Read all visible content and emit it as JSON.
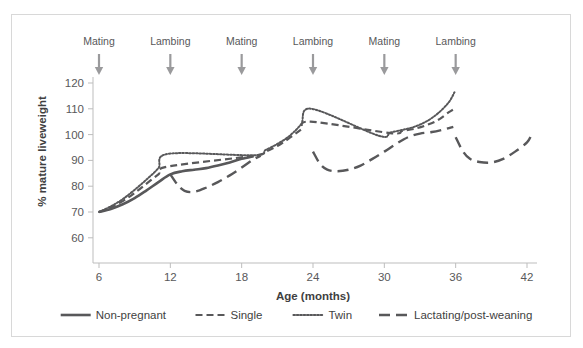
{
  "chart_data": {
    "type": "line",
    "title": "",
    "xlabel": "Age (months)",
    "ylabel": "% mature liveweight",
    "xlim": [
      6,
      42
    ],
    "ylim": [
      56,
      122
    ],
    "xticks": [
      6,
      12,
      18,
      24,
      30,
      36,
      42
    ],
    "yticks": [
      60,
      70,
      80,
      90,
      100,
      110,
      120
    ],
    "grid": false,
    "legend_position": "bottom",
    "line_color": "#58585a",
    "annotation_color": "#9a9a9c",
    "series": [
      {
        "name": "Non-pregnant",
        "style": "solid",
        "x": [
          6,
          7,
          8,
          9,
          10,
          11,
          12,
          13,
          14,
          15,
          16,
          17,
          18,
          19
        ],
        "values": [
          70,
          71.2,
          73.0,
          75.4,
          78.4,
          81.6,
          84.6,
          85.8,
          86.4,
          87.0,
          88.0,
          89.2,
          90.6,
          91.6
        ]
      },
      {
        "name": "Single",
        "style": "dashed",
        "x": [
          6,
          7,
          8,
          9,
          10,
          11,
          11.8,
          19,
          20,
          21,
          22,
          23,
          23.8,
          30.5,
          31.5,
          32.5,
          33.5,
          34.5,
          35.4,
          35.9
        ],
        "values": [
          70,
          71.8,
          74.2,
          77.4,
          81.0,
          84.6,
          87.6,
          91.8,
          93.4,
          95.6,
          98.6,
          102.0,
          105.0,
          100.6,
          101.4,
          102.2,
          103.6,
          105.6,
          108.6,
          110.0
        ]
      },
      {
        "name": "Twin",
        "style": "dotted",
        "x": [
          6,
          7,
          8,
          9,
          10,
          11,
          11.9,
          19,
          20,
          21,
          22,
          23,
          23.9,
          29.5,
          30.5,
          31.5,
          32.5,
          33.5,
          34.5,
          35.4,
          35.9
        ],
        "values": [
          70,
          72.2,
          75.0,
          78.6,
          82.6,
          87.0,
          92.6,
          92.0,
          94.0,
          96.4,
          99.4,
          104.0,
          110.0,
          99.6,
          100.8,
          101.8,
          103.0,
          105.0,
          108.2,
          112.4,
          116.4
        ]
      },
      {
        "name": "Lactating/post-weaning",
        "style": "long-dash",
        "segments": [
          {
            "x": [
              12,
              12.6,
              13.2,
              14,
              15,
              16,
              17,
              18,
              19,
              19.6
            ],
            "values": [
              84.6,
              80.6,
              78.2,
              77.8,
              79.4,
              81.6,
              84.2,
              87.2,
              90.4,
              91.8
            ]
          },
          {
            "x": [
              24,
              24.6,
              25.2,
              26,
              27,
              28,
              29,
              30,
              31,
              32,
              33,
              34,
              35,
              35.8
            ],
            "values": [
              93.4,
              88.6,
              86.4,
              85.8,
              86.4,
              88.0,
              90.6,
              93.4,
              96.4,
              99.0,
              100.4,
              101.0,
              102.0,
              103.0
            ]
          },
          {
            "x": [
              36,
              36.6,
              37.2,
              38,
              39,
              40,
              41,
              42,
              42.4
            ],
            "values": [
              99.0,
              93.6,
              90.6,
              89.4,
              89.2,
              90.6,
              93.4,
              97.0,
              100.2
            ]
          }
        ]
      }
    ],
    "annotations": [
      {
        "label": "Mating",
        "x": 6
      },
      {
        "label": "Lambing",
        "x": 12
      },
      {
        "label": "Mating",
        "x": 18
      },
      {
        "label": "Lambing",
        "x": 24
      },
      {
        "label": "Mating",
        "x": 30
      },
      {
        "label": "Lambing",
        "x": 36
      }
    ],
    "legend": [
      {
        "label": "Non-pregnant",
        "style": "solid"
      },
      {
        "label": "Single",
        "style": "dashed"
      },
      {
        "label": "Twin",
        "style": "dotted"
      },
      {
        "label": "Lactating/post-weaning",
        "style": "long-dash"
      }
    ]
  }
}
